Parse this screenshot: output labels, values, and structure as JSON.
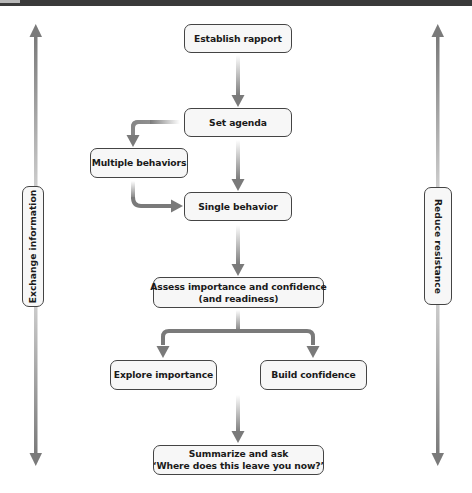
{
  "diagram": {
    "type": "flowchart",
    "colors": {
      "arrow": "#7a7a7a",
      "node_border": "#444444",
      "node_fill": "#f7f7f7",
      "text": "#1a1a1a"
    },
    "nodes": {
      "establish_rapport": "Establish rapport",
      "set_agenda": "Set agenda",
      "multiple_behaviors": "Multiple behaviors",
      "single_behavior": "Single behavior",
      "assess_line1": "Assess importance and confidence",
      "assess_line2": "(and readiness)",
      "explore_importance": "Explore importance",
      "build_confidence": "Build confidence",
      "summarize_line1": "Summarize and ask",
      "summarize_line2": "‘Where does this leave you now?’"
    },
    "side_labels": {
      "left": "Exchange information",
      "right": "Reduce resistance"
    },
    "edges": [
      {
        "from": "Establish rapport",
        "to": "Set agenda"
      },
      {
        "from": "Set agenda",
        "to": "Multiple behaviors"
      },
      {
        "from": "Set agenda",
        "to": "Single behavior"
      },
      {
        "from": "Multiple behaviors",
        "to": "Single behavior"
      },
      {
        "from": "Single behavior",
        "to": "Assess importance and confidence (and readiness)"
      },
      {
        "from": "Assess importance and confidence (and readiness)",
        "to": "Explore importance"
      },
      {
        "from": "Assess importance and confidence (and readiness)",
        "to": "Build confidence"
      },
      {
        "from": "Explore importance / Build confidence",
        "to": "Summarize and ask"
      }
    ],
    "side_arrows": [
      "bidirectional-vertical-left",
      "bidirectional-vertical-right"
    ]
  }
}
